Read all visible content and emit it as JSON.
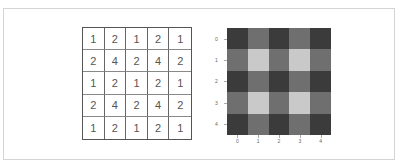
{
  "matrix": {
    "rows": [
      [
        1,
        2,
        1,
        2,
        1
      ],
      [
        2,
        4,
        2,
        4,
        2
      ],
      [
        1,
        2,
        1,
        2,
        1
      ],
      [
        2,
        4,
        2,
        4,
        2
      ],
      [
        1,
        2,
        1,
        2,
        1
      ]
    ]
  },
  "heatmap": {
    "x_ticks": [
      "0",
      "1",
      "2",
      "3",
      "4"
    ],
    "y_ticks": [
      "0",
      "1",
      "2",
      "3",
      "4"
    ],
    "colors": {
      "1": "#3b3b3b",
      "2": "#6f6f6f",
      "4": "#c9c9c9"
    }
  }
}
